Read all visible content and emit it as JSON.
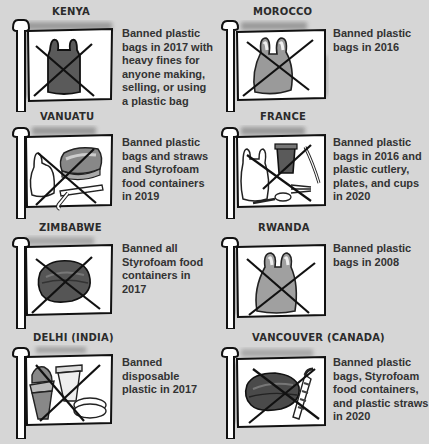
{
  "palette": {
    "background": "#d6d6d6",
    "flag": "#ffffff",
    "outline": "#111111",
    "item_dark": "#5a5a5a",
    "item_mid": "#9a9a9a",
    "item_light": "#e8e8e8",
    "shadow": "#8a8a8a",
    "text": "#2b2b2b"
  },
  "bans": [
    {
      "place": "KENYA",
      "description": "Banned plastic bags in 2017 with heavy fines for anyone making, selling, or using a plastic bag",
      "icon": "plastic-bag-dark-icon"
    },
    {
      "place": "MOROCCO",
      "description": "Banned plastic bags in 2016",
      "icon": "plastic-bag-gray-icon"
    },
    {
      "place": "VANUATU",
      "description": "Banned plastic bags and straws and Styrofoam food containers in 2019",
      "icon": "bag-container-straw-icon"
    },
    {
      "place": "FRANCE",
      "description": "Banned plastic bags in 2016 and plastic cutlery, plates, and cups in 2020",
      "icon": "bag-cup-cutlery-icon"
    },
    {
      "place": "ZIMBABWE",
      "description": "Banned all Styrofoam food containers in 2017",
      "icon": "foam-container-icon"
    },
    {
      "place": "RWANDA",
      "description": "Banned plastic bags in 2008",
      "icon": "plastic-bag-gray-icon"
    },
    {
      "place": "DELHI (INDIA)",
      "description": "Banned disposable plastic in 2017",
      "icon": "cups-plates-icon"
    },
    {
      "place": "VANCOUVER (CANADA)",
      "description": "Banned plastic bags, Styrofoam food containers, and plastic straws in 2020",
      "icon": "container-straw-icon"
    }
  ]
}
